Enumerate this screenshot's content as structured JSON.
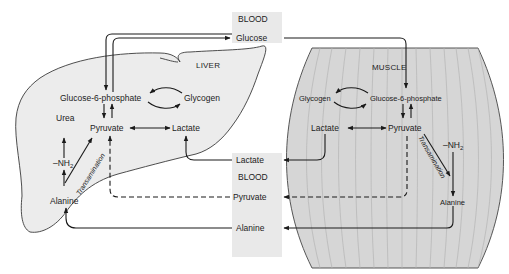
{
  "diagram": {
    "type": "metabolic-pathway",
    "colors": {
      "background": "#ffffff",
      "liver_fill": "#ececec",
      "muscle_fill": "#d6d6d6",
      "muscle_striation": "#b9b9b9",
      "blood_box": "#e9e9e9",
      "line": "#1a1a1a"
    },
    "blood_top": {
      "title": "BLOOD",
      "glucose": "Glucose"
    },
    "blood_bottom": {
      "title": "BLOOD",
      "lactate": "Lactate",
      "pyruvate": "Pyruvate",
      "alanine": "Alanine"
    },
    "liver": {
      "title": "LIVER",
      "glucose_6_phosphate": "Glucose-6-phosphate",
      "glycogen": "Glycogen",
      "pyruvate": "Pyruvate",
      "lactate": "Lactate",
      "urea": "Urea",
      "nh2_prefix": "–NH",
      "nh2_sub": "2",
      "transamination": "Transamination",
      "alanine": "Alanine"
    },
    "muscle": {
      "title": "MUSCLE",
      "glycogen": "Glycogen",
      "glucose_6_phosphate": "Glucose-6-phosphate",
      "lactate": "Lactate",
      "pyruvate": "Pyruvate",
      "nh2_prefix": "–NH",
      "nh2_sub": "2",
      "transamination": "Transamination",
      "alanine": "Alanine"
    },
    "flows": [
      {
        "from": "Blood Glucose",
        "to": "Liver Glucose-6-phosphate",
        "style": "solid"
      },
      {
        "from": "Liver Glucose-6-phosphate",
        "to": "Blood Glucose",
        "style": "solid"
      },
      {
        "from": "Blood Glucose",
        "to": "Muscle Glucose-6-phosphate",
        "style": "solid"
      },
      {
        "from": "Muscle Lactate",
        "to": "Blood Lactate",
        "style": "solid"
      },
      {
        "from": "Blood Lactate",
        "to": "Liver Lactate",
        "style": "solid"
      },
      {
        "from": "Muscle Pyruvate",
        "to": "Blood Pyruvate",
        "style": "dashed"
      },
      {
        "from": "Blood Pyruvate",
        "to": "Liver Pyruvate",
        "style": "dashed"
      },
      {
        "from": "Muscle Alanine",
        "to": "Blood Alanine",
        "style": "solid"
      },
      {
        "from": "Blood Alanine",
        "to": "Liver Alanine",
        "style": "solid"
      }
    ]
  }
}
